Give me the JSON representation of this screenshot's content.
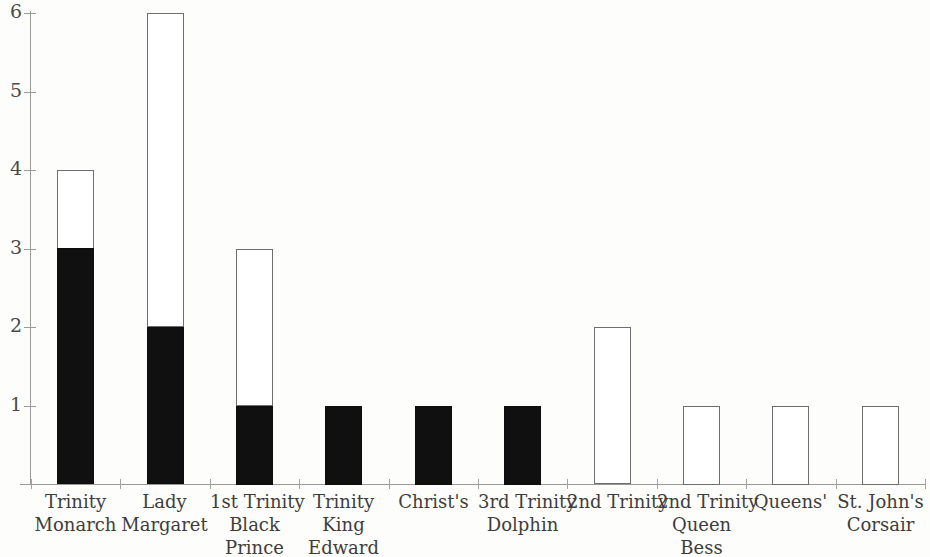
{
  "chart_data": {
    "type": "bar",
    "subtype": "stacked-bar",
    "title": "",
    "xlabel": "",
    "ylabel": "",
    "ylim": [
      0,
      6
    ],
    "y_ticks": [
      1,
      2,
      3,
      4,
      5,
      6
    ],
    "y_tick_labels": [
      "1",
      "2",
      "3",
      "4",
      "5",
      "6"
    ],
    "grid": false,
    "legend": null,
    "categories": [
      "Trinity Monarch",
      "Lady Margaret",
      "1st Trinity Black Prince",
      "Trinity King Edward",
      "Christ's",
      "3rd Trinity Dolphin",
      "2nd Trinity",
      "2nd Trinity Queen Bess",
      "Queens'",
      "St. John's Corsair"
    ],
    "category_label_lines": [
      [
        "Trinity",
        "Monarch"
      ],
      [
        "Lady",
        "Margaret"
      ],
      [
        "1st Trinity",
        "Black",
        "Prince"
      ],
      [
        "Trinity",
        "King",
        "Edward"
      ],
      [
        "Christ's"
      ],
      [
        "3rd Trinity",
        "Dolphin"
      ],
      [
        "2nd Trinity"
      ],
      [
        "2nd Trinity",
        "Queen",
        "Bess"
      ],
      [
        "Queens'"
      ],
      [
        "St. John's",
        "Corsair"
      ]
    ],
    "series": [
      {
        "name": "filled",
        "color": "#0d0d0d",
        "values": [
          3,
          2,
          1,
          1,
          1,
          1,
          0,
          0,
          0,
          0
        ]
      },
      {
        "name": "open",
        "color": "#ffffff",
        "values": [
          1,
          4,
          2,
          0,
          0,
          0,
          2,
          1,
          1,
          1
        ]
      }
    ],
    "totals": [
      4,
      6,
      3,
      1,
      1,
      1,
      2,
      1,
      1,
      1
    ]
  },
  "colors": {
    "filled": "#0d0d0d",
    "open": "#ffffff",
    "outline": "#6e6e6e",
    "axis": "#9a9a96",
    "text": "#3d3d3b",
    "background": "#fdfdfb"
  }
}
